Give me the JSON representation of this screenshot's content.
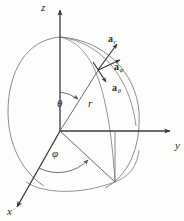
{
  "figure": {
    "background_color": "#fdfdfb",
    "stroke_color": "#4a4a4a",
    "axis_color": "#3a3a3a",
    "text_color": "#2b2b2b"
  },
  "axes": {
    "z": "z",
    "y": "y",
    "x": "x"
  },
  "angles": {
    "theta": "θ",
    "phi": "φ"
  },
  "radius": {
    "label": "r"
  },
  "vectors": [
    {
      "key": "a_r",
      "base": "a",
      "sub": "r",
      "label": "a"
    },
    {
      "key": "a_phi",
      "base": "a",
      "sub": "φ",
      "label": "a"
    },
    {
      "key": "a_theta",
      "base": "a",
      "sub": "θ",
      "label": "a"
    }
  ],
  "geometry": {
    "origin": [
      60,
      131
    ],
    "sphere_radius_px": 78,
    "point_on_sphere": [
      98,
      70
    ],
    "equator_projection_point": [
      115,
      182
    ]
  }
}
